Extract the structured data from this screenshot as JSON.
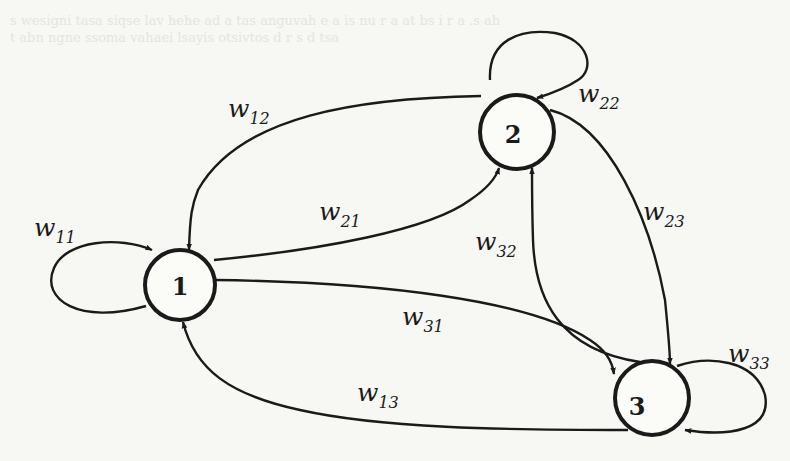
{
  "diagram": {
    "type": "fully-connected weighted directed graph (recurrent network)",
    "nodes": [
      {
        "id": "1",
        "label": "1",
        "cx": 180,
        "cy": 285,
        "r": 35
      },
      {
        "id": "2",
        "label": "2",
        "cx": 517,
        "cy": 132,
        "r": 37
      },
      {
        "id": "3",
        "label": "3",
        "cx": 652,
        "cy": 398,
        "r": 37
      }
    ],
    "edges": [
      {
        "from": "1",
        "to": "1",
        "label": "w",
        "sub": "11"
      },
      {
        "from": "2",
        "to": "1",
        "label": "w",
        "sub": "12"
      },
      {
        "from": "1",
        "to": "2",
        "label": "w",
        "sub": "21"
      },
      {
        "from": "2",
        "to": "2",
        "label": "w",
        "sub": "22"
      },
      {
        "from": "2",
        "to": "3",
        "label": "w",
        "sub": "23"
      },
      {
        "from": "3",
        "to": "2",
        "label": "w",
        "sub": "32"
      },
      {
        "from": "1",
        "to": "3",
        "label": "w",
        "sub": "31"
      },
      {
        "from": "3",
        "to": "1",
        "label": "w",
        "sub": "13"
      },
      {
        "from": "3",
        "to": "3",
        "label": "w",
        "sub": "33"
      }
    ]
  },
  "labels": {
    "w11": {
      "main": "w",
      "sub": "11"
    },
    "w12": {
      "main": "w",
      "sub": "12"
    },
    "w21": {
      "main": "w",
      "sub": "21"
    },
    "w22": {
      "main": "w",
      "sub": "22"
    },
    "w23": {
      "main": "w",
      "sub": "23"
    },
    "w32": {
      "main": "w",
      "sub": "32"
    },
    "w31": {
      "main": "w",
      "sub": "31"
    },
    "w13": {
      "main": "w",
      "sub": "13"
    },
    "w33": {
      "main": "w",
      "sub": "33"
    }
  },
  "nodes": {
    "n1": "1",
    "n2": "2",
    "n3": "3"
  },
  "colors": {
    "ink": "#1a1a1a",
    "paper": "#f7f7f4"
  }
}
